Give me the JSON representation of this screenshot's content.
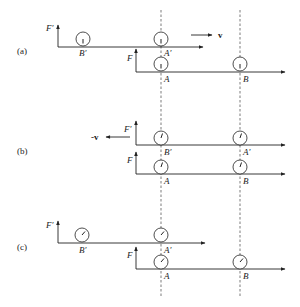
{
  "figure": {
    "panels": [
      {
        "id": "a",
        "label": "(a)",
        "velocity_label": "v",
        "velocity_direction": "right",
        "primed_frame": {
          "axis_label": "F′",
          "clocks": [
            {
              "label": "B′",
              "hand": "down"
            },
            {
              "label": "A′",
              "hand": "down"
            }
          ]
        },
        "unprimed_frame": {
          "axis_label": "F",
          "clocks": [
            {
              "label": "A",
              "hand": "down"
            },
            {
              "label": "B",
              "hand": "down"
            }
          ]
        }
      },
      {
        "id": "b",
        "label": "(b)",
        "velocity_label": "-v",
        "velocity_direction": "left",
        "primed_frame": {
          "axis_label": "F′",
          "clocks": [
            {
              "label": "B′",
              "hand": "slight-tilt"
            },
            {
              "label": "A′",
              "hand": "slight-tilt"
            }
          ]
        },
        "unprimed_frame": {
          "axis_label": "F",
          "clocks": [
            {
              "label": "A",
              "hand": "slight-tilt"
            },
            {
              "label": "B",
              "hand": "slight-tilt"
            }
          ]
        }
      },
      {
        "id": "c",
        "label": "(c)",
        "primed_frame": {
          "axis_label": "F′",
          "clocks": [
            {
              "label": "B′",
              "hand": "up-right"
            },
            {
              "label": "A′",
              "hand": "up-right"
            }
          ]
        },
        "unprimed_frame": {
          "axis_label": "F",
          "clocks": [
            {
              "label": "A",
              "hand": "up-right"
            },
            {
              "label": "B",
              "hand": "up-right"
            }
          ]
        }
      }
    ]
  }
}
